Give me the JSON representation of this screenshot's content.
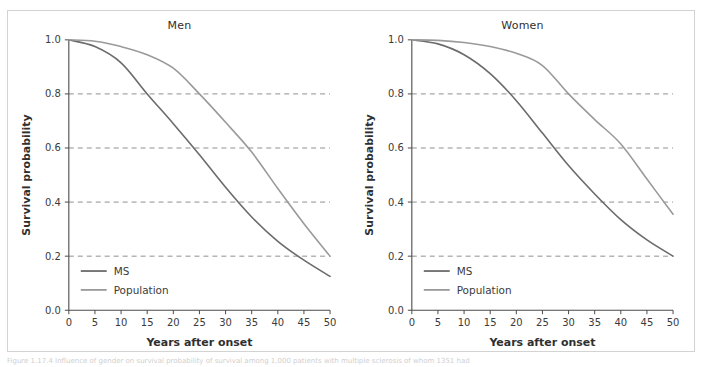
{
  "figure": {
    "caption": "Figure 1.17.4 Influence of gender on survival probability of survival among 1,000 patients with multiple sclerosis of whom 1351 had"
  },
  "chart_data": [
    {
      "type": "line",
      "title": "Men",
      "xlabel": "Years after onset",
      "ylabel": "Survival probability",
      "xlim": [
        0,
        50
      ],
      "ylim": [
        0.0,
        1.0
      ],
      "xticks": [
        0,
        5,
        10,
        15,
        20,
        25,
        30,
        35,
        40,
        45,
        50
      ],
      "yticks": [
        0.0,
        0.2,
        0.4,
        0.6,
        0.8,
        1.0
      ],
      "ytick_labels": [
        "0.0",
        "0.2",
        "0.4",
        "0.6",
        "0.8",
        "1.0"
      ],
      "xtick_labels": [
        "0",
        "5",
        "10",
        "15",
        "20",
        "25",
        "30",
        "35",
        "40",
        "45",
        "50"
      ],
      "grid": "horizontal-dashed-at-0.2-0.4-0.6-0.8",
      "legend_position": "bottom-left",
      "x": [
        0,
        5,
        10,
        15,
        20,
        25,
        30,
        35,
        40,
        45,
        50
      ],
      "series": [
        {
          "name": "MS",
          "color": "#6b6b6b",
          "values": [
            1.0,
            0.975,
            0.915,
            0.8,
            0.69,
            0.575,
            0.455,
            0.345,
            0.255,
            0.185,
            0.125
          ]
        },
        {
          "name": "Population",
          "color": "#9a9a9a",
          "values": [
            1.0,
            0.995,
            0.975,
            0.945,
            0.895,
            0.8,
            0.695,
            0.585,
            0.45,
            0.32,
            0.2
          ]
        }
      ]
    },
    {
      "type": "line",
      "title": "Women",
      "xlabel": "Years after onset",
      "ylabel": "Survival probability",
      "xlim": [
        0,
        50
      ],
      "ylim": [
        0.0,
        1.0
      ],
      "xticks": [
        0,
        5,
        10,
        15,
        20,
        25,
        30,
        35,
        40,
        45,
        50
      ],
      "yticks": [
        0.0,
        0.2,
        0.4,
        0.6,
        0.8,
        1.0
      ],
      "ytick_labels": [
        "0.0",
        "0.2",
        "0.4",
        "0.6",
        "0.8",
        "1.0"
      ],
      "xtick_labels": [
        "0",
        "5",
        "10",
        "15",
        "20",
        "25",
        "30",
        "35",
        "40",
        "45",
        "50"
      ],
      "grid": "horizontal-dashed-at-0.2-0.4-0.6-0.8",
      "legend_position": "bottom-left",
      "x": [
        0,
        5,
        10,
        15,
        20,
        25,
        30,
        35,
        40,
        45,
        50
      ],
      "series": [
        {
          "name": "MS",
          "color": "#6b6b6b",
          "values": [
            1.0,
            0.985,
            0.945,
            0.875,
            0.775,
            0.655,
            0.535,
            0.43,
            0.335,
            0.26,
            0.2
          ]
        },
        {
          "name": "Population",
          "color": "#9a9a9a",
          "values": [
            1.0,
            0.998,
            0.99,
            0.975,
            0.95,
            0.905,
            0.8,
            0.705,
            0.615,
            0.485,
            0.355
          ]
        }
      ]
    }
  ]
}
